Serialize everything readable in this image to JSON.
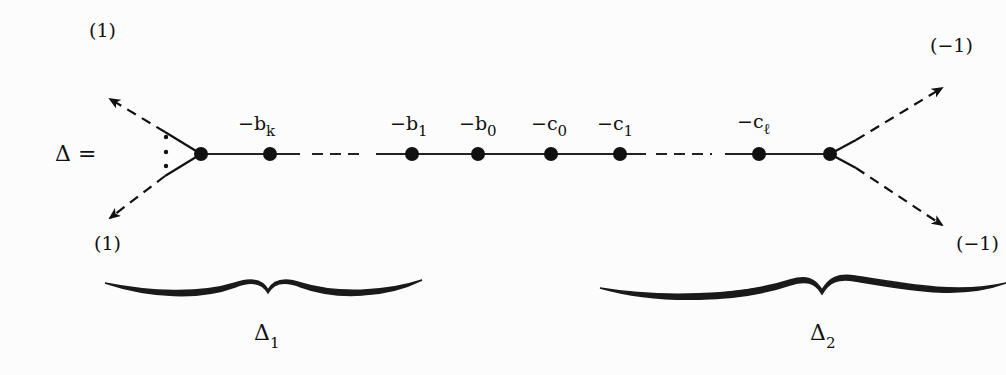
{
  "diagram": {
    "lhs": "Δ =",
    "left_vertex": {
      "x": 201,
      "y": 154,
      "arrows": [
        {
          "to": [
            110,
            117
          ],
          "label": "(1)",
          "direction": "up-left"
        },
        {
          "to": [
            110,
            215
          ],
          "label": "(1)",
          "direction": "down-left"
        }
      ],
      "ellipsis": "⋮"
    },
    "right_vertex": {
      "x": 830,
      "y": 154,
      "arrows": [
        {
          "to": [
            941,
            88
          ],
          "label": "(−1)",
          "direction": "up-right"
        },
        {
          "to": [
            941,
            225
          ],
          "label": "(−1)",
          "direction": "down-right"
        }
      ]
    },
    "nodes": [
      {
        "x": 270,
        "base": "−b",
        "sub": "k"
      },
      {
        "x": 412,
        "base": "−b",
        "sub": "1"
      },
      {
        "x": 478,
        "base": "−b",
        "sub": "0"
      },
      {
        "x": 551,
        "base": "−c",
        "sub": "0"
      },
      {
        "x": 620,
        "base": "−c",
        "sub": "1"
      },
      {
        "x": 759,
        "base": "−c",
        "sub": "ℓ"
      }
    ],
    "braces": [
      {
        "label": "Δ",
        "sub": "1",
        "x1": 100,
        "x2": 422
      },
      {
        "label": "Δ",
        "sub": "2",
        "x1": 600,
        "x2": 1000
      }
    ]
  }
}
